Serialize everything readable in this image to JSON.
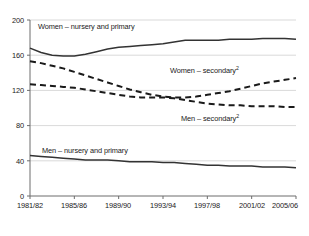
{
  "chart_data": {
    "type": "line",
    "title": "",
    "subtitle": "",
    "xlabel": "",
    "ylabel": "",
    "ylim": [
      0,
      200
    ],
    "yticks": [
      0,
      40,
      80,
      120,
      160,
      200
    ],
    "ytick_labels": [
      "0",
      "40",
      "80",
      "120",
      "160",
      "200"
    ],
    "grid": true,
    "grid_axis": "y",
    "legend_position": "inline-annotations",
    "x": [
      "1981/82",
      "1982/83",
      "1983/84",
      "1984/85",
      "1985/86",
      "1986/87",
      "1987/88",
      "1988/89",
      "1989/90",
      "1990/91",
      "1991/92",
      "1992/93",
      "1993/94",
      "1994/95",
      "1995/96",
      "1996/97",
      "1997/98",
      "1998/99",
      "1999/00",
      "2000/01",
      "2001/02",
      "2002/03",
      "2003/04",
      "2004/05",
      "2005/06"
    ],
    "xtick_labels": [
      "1981/82",
      "1985/86",
      "1989/90",
      "1993/94",
      "1997/98",
      "2001/02",
      "2005/06"
    ],
    "xtick_indices": [
      0,
      4,
      8,
      12,
      16,
      20,
      24
    ],
    "series": [
      {
        "name": "Women – nursery and primary",
        "style": "solid",
        "color": "#333333",
        "values": [
          168,
          163,
          160,
          159,
          159,
          161,
          164,
          167,
          169,
          170,
          171,
          172,
          173,
          175,
          177,
          177,
          177,
          177,
          178,
          178,
          178,
          179,
          179,
          179,
          178
        ]
      },
      {
        "name": "Women – secondary",
        "style": "dashed",
        "color": "#1a1a1a",
        "footnote_marker": "2",
        "values": [
          153,
          151,
          148,
          145,
          141,
          137,
          133,
          129,
          125,
          121,
          118,
          115,
          113,
          112,
          112,
          113,
          115,
          117,
          119,
          122,
          125,
          128,
          130,
          132,
          134
        ]
      },
      {
        "name": "Men – secondary",
        "style": "dashed",
        "color": "#1a1a1a",
        "footnote_marker": "2",
        "values": [
          127,
          126,
          125,
          124,
          123,
          121,
          119,
          117,
          115,
          113,
          112,
          112,
          112,
          111,
          109,
          107,
          105,
          104,
          103,
          103,
          102,
          102,
          102,
          101,
          101
        ]
      },
      {
        "name": "Men – nursery and primary",
        "style": "solid",
        "color": "#333333",
        "values": [
          46,
          45,
          44,
          43,
          42,
          41,
          41,
          41,
          40,
          39,
          39,
          39,
          38,
          38,
          37,
          36,
          35,
          35,
          34,
          34,
          34,
          33,
          33,
          33,
          32
        ]
      }
    ],
    "annotations": [
      {
        "id": "women-nursery-primary",
        "text": "Women – nursery and primary",
        "x_px": 38,
        "y_px": 26
      },
      {
        "id": "women-secondary",
        "text": "Women – secondary",
        "sup": "2",
        "x_px": 170,
        "y_px": 70
      },
      {
        "id": "men-secondary",
        "text": "Men – secondary",
        "sup": "2",
        "x_px": 180,
        "y_px": 118
      },
      {
        "id": "men-nursery-primary",
        "text": "Men – nursery and primary",
        "x_px": 42,
        "y_px": 150
      }
    ],
    "footnote": "2"
  },
  "footnote_text": ""
}
